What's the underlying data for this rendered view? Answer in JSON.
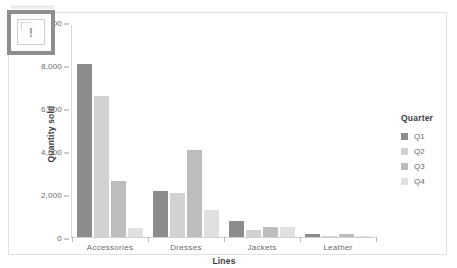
{
  "chart_data": {
    "type": "bar",
    "title": "",
    "xlabel": "Lines",
    "ylabel": "Quantity sold",
    "categories": [
      "Accessories",
      "Dresses",
      "Jackets",
      "Leather"
    ],
    "series": [
      {
        "name": "Q1",
        "color": "#8c8c8c",
        "values": [
          8100,
          2150,
          750,
          150
        ]
      },
      {
        "name": "Q2",
        "color": "#d2d2d2",
        "values": [
          6600,
          2050,
          350,
          60
        ]
      },
      {
        "name": "Q3",
        "color": "#bdbdbd",
        "values": [
          2600,
          4050,
          480,
          120
        ]
      },
      {
        "name": "Q4",
        "color": "#e0e0e0",
        "values": [
          400,
          1250,
          480,
          60
        ]
      }
    ],
    "ylim": [
      0,
      10000
    ],
    "yticks": [
      0,
      2000,
      4000,
      6000,
      8000,
      10000
    ],
    "ytick_labels": [
      "0",
      "2,000",
      "4,000",
      "6,000",
      "8,000",
      "10,000"
    ],
    "grid": false,
    "legend_position": "right",
    "legend_title": "Quarter"
  },
  "legend": {
    "title": "Quarter",
    "items": [
      {
        "label": "Q1",
        "color": "#8c8c8c"
      },
      {
        "label": "Q2",
        "color": "#d2d2d2"
      },
      {
        "label": "Q3",
        "color": "#bdbdbd"
      },
      {
        "label": "Q4",
        "color": "#e0e0e0"
      }
    ]
  },
  "overlay": {
    "broken_image_glyph": "!",
    "icon_name": "broken-image-icon"
  },
  "colors": {
    "card_border": "#e3e3e3",
    "axis": "#d0d0d0",
    "tick_text": "#6a6a6a",
    "title_text": "#3d3d3d",
    "overlay_border": "#8e8e8e"
  }
}
